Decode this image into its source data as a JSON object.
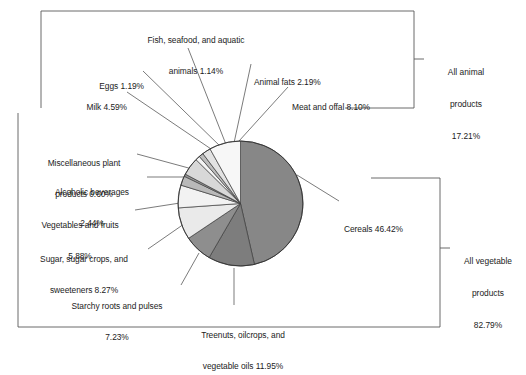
{
  "figure": {
    "title": "",
    "background_color": "#ffffff",
    "line_color": "#555555",
    "text_color": "#1b1b1b"
  },
  "groups": {
    "animal": {
      "name": "animal-products-bracket",
      "line1": "All animal",
      "line2": "products",
      "line3": "17.21%",
      "label": "All animal products 17.21%",
      "value": 17.21
    },
    "vegetable": {
      "name": "vegetable-products-bracket",
      "line1": "All vegetable",
      "line2": "products",
      "line3": "82.79%",
      "label": "All vegetable products 82.79%",
      "value": 82.79
    }
  },
  "labels": {
    "fish": {
      "line1": "Fish, seafood, and aquatic",
      "line2": "animals 1.14%"
    },
    "eggs": {
      "line1": "Eggs 1.19%"
    },
    "milk": {
      "line1": "Milk 4.59%"
    },
    "animal_fats": {
      "line1": "Animal fats 2.19%"
    },
    "meat": {
      "line1": "Meat and offal 8.10%"
    },
    "misc_plant": {
      "line1": "Miscellaneous plant",
      "line2": "products 0.60%"
    },
    "alcohol": {
      "line1": "Alcoholic beverages",
      "line2": "2.44%"
    },
    "veg_fruit": {
      "line1": "Vegetables and fruits",
      "line2": "5.88%"
    },
    "sugar": {
      "line1": "Sugar, sugar crops, and",
      "line2": "sweeteners 8.27%"
    },
    "starchy": {
      "line1": "Starchy roots and pulses",
      "line2": "7.23%"
    },
    "cereals": {
      "line1": "Cereals 46.42%"
    },
    "treenuts": {
      "line1": "Treenuts, oilcrops, and",
      "line2": "vegetable oils 11.95%"
    }
  },
  "chart_data": {
    "type": "pie",
    "title": "",
    "xlabel": "",
    "ylabel": "",
    "units": "percent",
    "start_angle_deg": 0,
    "direction": "clockwise",
    "total": 100.0,
    "legend_position": "callout-labels",
    "grid": false,
    "categories": [
      "Cereals",
      "Treenuts, oilcrops, and vegetable oils",
      "Starchy roots and pulses",
      "Sugar, sugar crops, and sweeteners",
      "Vegetables and fruits",
      "Alcoholic beverages",
      "Miscellaneous plant products",
      "Milk",
      "Eggs",
      "Fish, seafood, and aquatic animals",
      "Animal fats",
      "Meat and offal"
    ],
    "values": [
      46.42,
      11.95,
      7.23,
      8.27,
      5.88,
      2.44,
      0.6,
      4.59,
      1.19,
      1.14,
      2.19,
      8.1
    ],
    "colors": [
      "#878787",
      "#7d7d7d",
      "#8e8e8e",
      "#eaeaea",
      "#f2f2f2",
      "#b9b9b9",
      "#9a9a9a",
      "#d8d8d8",
      "#f4f4f4",
      "#bdbdbd",
      "#e2e2e2",
      "#f7f7f7"
    ],
    "groups": [
      {
        "name": "All vegetable products",
        "value": 82.79,
        "members": [
          "Cereals",
          "Treenuts, oilcrops, and vegetable oils",
          "Starchy roots and pulses",
          "Sugar, sugar crops, and sweeteners",
          "Vegetables and fruits",
          "Alcoholic beverages",
          "Miscellaneous plant products"
        ]
      },
      {
        "name": "All animal products",
        "value": 17.21,
        "members": [
          "Milk",
          "Eggs",
          "Fish, seafood, and aquatic animals",
          "Animal fats",
          "Meat and offal"
        ]
      }
    ]
  }
}
